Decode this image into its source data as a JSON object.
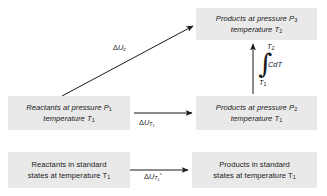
{
  "diagram": {
    "background_color": "#ffffff",
    "box_fill_color": "#e9e9e9",
    "line_color": "#1a1a1a"
  },
  "boxes": {
    "products_p3": {
      "line1": "Products at pressure P",
      "line1_sub": "3",
      "line2": "temperature T",
      "line2_sub": "2"
    },
    "reactants_p1": {
      "line1": "Reactants at pressure P",
      "line1_sub": "1",
      "line2": "temperature T",
      "line2_sub": "1"
    },
    "products_p2": {
      "line1": "Products at pressure P",
      "line1_sub": "2",
      "line2": "temperature T",
      "line2_sub": "1"
    },
    "reactants_standard": {
      "line1": "Reactants in standard",
      "line2": "states at temperature T",
      "line2_sub": "1"
    },
    "products_standard": {
      "line1": "Products in standard",
      "line2": "states at temperature T",
      "line2_sub": "1"
    }
  },
  "arrow_labels": {
    "combustion": {
      "delta": "Δ",
      "symbol": "U",
      "subscript": "c"
    },
    "isothermal_t1": {
      "delta": "Δ",
      "symbol": "U",
      "subscript": "T",
      "subscript_sub": "1"
    },
    "standard_t1": {
      "delta": "Δ",
      "symbol": "U",
      "subscript": "T",
      "subscript_sub": "1",
      "superscript": "°"
    }
  },
  "integral": {
    "upper_limit": "T",
    "upper_limit_sub": "2",
    "lower_limit": "T",
    "lower_limit_sub": "1",
    "sign": "∫",
    "integrand": "CdT"
  }
}
